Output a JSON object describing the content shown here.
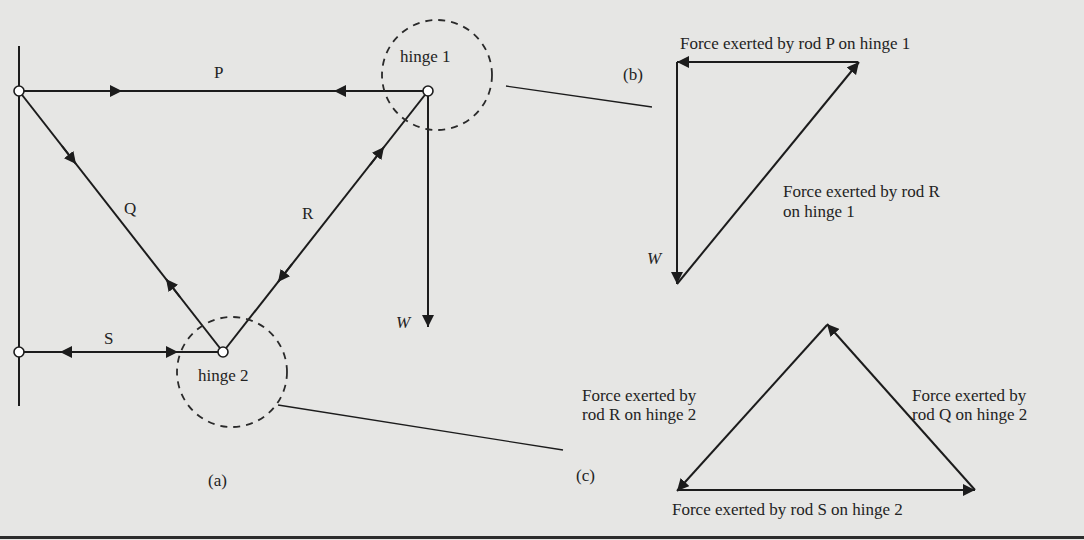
{
  "figure": {
    "panel_a": {
      "label": "(a)",
      "rods": {
        "P": "P",
        "Q": "Q",
        "R": "R",
        "S": "S"
      },
      "hinge1_label": "hinge 1",
      "hinge2_label": "hinge 2",
      "weight_label": "W"
    },
    "panel_b": {
      "label": "(b)",
      "force_P": "Force exerted by rod P on hinge 1",
      "force_R_line1": "Force exerted by rod R",
      "force_R_line2": "on hinge 1",
      "weight_label": "W"
    },
    "panel_c": {
      "label": "(c)",
      "force_R_line1": "Force exerted by",
      "force_R_line2": "rod R on hinge 2",
      "force_Q_line1": "Force exerted by",
      "force_Q_line2": "rod Q on hinge 2",
      "force_S": "Force exerted by rod S on hinge 2"
    },
    "colors": {
      "background": "#e6e6e4",
      "ink": "#1c1c1c"
    }
  }
}
